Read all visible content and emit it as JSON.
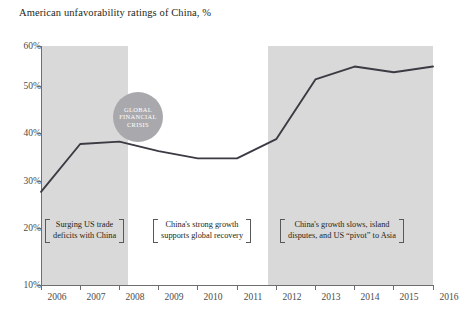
{
  "chart_data": {
    "type": "line",
    "title": "American unfavorability ratings of China, %",
    "xlabel": "",
    "ylabel": "",
    "x": [
      2006,
      2007,
      2008,
      2009,
      2010,
      2011,
      2012,
      2013,
      2014,
      2015,
      2016
    ],
    "categories": [
      "2006",
      "2007",
      "2008",
      "2009",
      "2010",
      "2011",
      "2012",
      "2013",
      "2014",
      "2015",
      "2016"
    ],
    "values": [
      29.5,
      39.5,
      40.0,
      38.0,
      36.5,
      36.5,
      40.5,
      53.0,
      55.7,
      54.5,
      55.7
    ],
    "series": [
      {
        "name": "American unfavorability ratings of China",
        "values": [
          29.5,
          39.5,
          40.0,
          38.0,
          36.5,
          36.5,
          40.5,
          53.0,
          55.7,
          54.5,
          55.7
        ]
      }
    ],
    "ylim": [
      10,
      60
    ],
    "yticks": [
      10,
      20,
      30,
      40,
      50,
      60
    ],
    "ytick_labels": [
      "10%",
      "20%",
      "30%",
      "40%",
      "50%",
      "60%"
    ],
    "xlim": [
      2006,
      2016
    ],
    "grid": false,
    "legend": "none",
    "line_color": "#3b3b44",
    "band_color": "#d9d9d9",
    "shaded_bands": [
      {
        "name": "band-early",
        "from": 2006,
        "to": 2008
      },
      {
        "name": "band-late",
        "from": 2012,
        "to": 2016
      }
    ],
    "annotations": [
      {
        "name": "global-financial-crisis",
        "type": "circle-callout",
        "at_year": 2008,
        "at_value": 44,
        "lines": [
          "GLOBAL",
          "FINANCIAL",
          "CRISIS"
        ]
      },
      {
        "name": "trade-deficits",
        "type": "bracket-note",
        "text": "Surging US trade\ndeficits with China"
      },
      {
        "name": "strong-growth",
        "type": "bracket-note",
        "text": "China's strong growth\nsupports global recovery"
      },
      {
        "name": "growth-slows",
        "type": "bracket-note",
        "text": "China's growth slows, island\ndisputes, and US “pivot” to Asia"
      }
    ]
  },
  "caption": {
    "text": ""
  }
}
